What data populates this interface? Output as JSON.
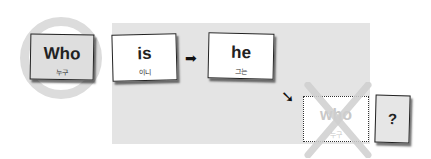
{
  "diagram": {
    "focus_card": {
      "word": "Who",
      "meaning": "누구"
    },
    "cards": [
      {
        "word": "is",
        "meaning": "이니"
      },
      {
        "word": "he",
        "meaning": "그는"
      }
    ],
    "crossed_card": {
      "word": "who",
      "meaning": "누구"
    },
    "question_card": {
      "word": "?"
    },
    "arrows": {
      "right": "➡",
      "down_right": "➘"
    },
    "colors": {
      "panel": "#e4e4e4",
      "ring": "#dcdcdc",
      "cross": "#d0d0d0"
    }
  }
}
